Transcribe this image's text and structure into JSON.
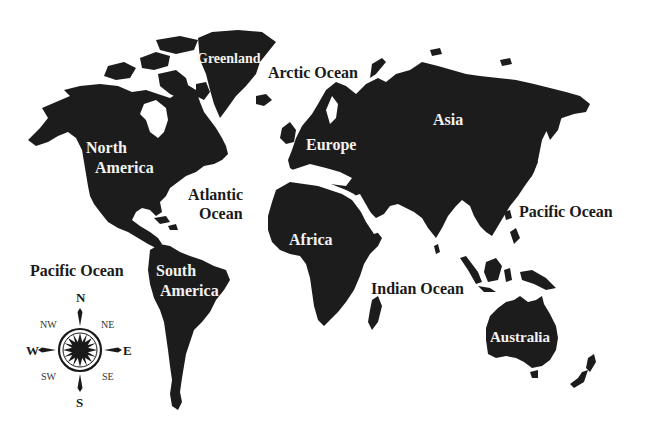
{
  "map": {
    "title": "World Map",
    "style": {
      "land_color": "#1c1c1c",
      "water_color": "#ffffff",
      "land_label_color": "#f2f2f2",
      "ocean_label_color": "#1a1a1a"
    },
    "continents": [
      {
        "id": "north-america",
        "label_line1": "North",
        "label_line2": "America"
      },
      {
        "id": "south-america",
        "label_line1": "South",
        "label_line2": "America"
      },
      {
        "id": "europe",
        "label": "Europe"
      },
      {
        "id": "asia",
        "label": "Asia"
      },
      {
        "id": "africa",
        "label": "Africa"
      },
      {
        "id": "australia",
        "label": "Australia"
      },
      {
        "id": "greenland",
        "label": "Greenland"
      }
    ],
    "oceans": [
      {
        "id": "arctic",
        "label": "Arctic Ocean"
      },
      {
        "id": "atlantic",
        "label_line1": "Atlantic",
        "label_line2": "Ocean"
      },
      {
        "id": "pacific-east",
        "label": "Pacific Ocean"
      },
      {
        "id": "pacific-west",
        "label": "Pacific Ocean"
      },
      {
        "id": "indian",
        "label": "Indian Ocean"
      }
    ],
    "compass": {
      "north": "N",
      "south": "S",
      "east": "E",
      "west": "W",
      "northeast": "NE",
      "northwest": "NW",
      "southeast": "SE",
      "southwest": "SW"
    }
  }
}
